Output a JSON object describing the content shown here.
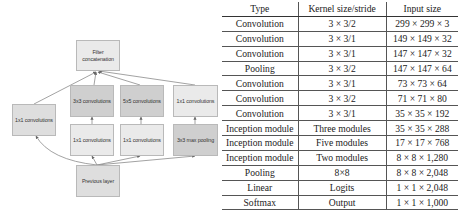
{
  "diagram": {
    "title": "Inception module",
    "nodes": {
      "filter_concat": "Filter concatenation",
      "conv1x1_left": "1x1 convolutions",
      "conv3x3": "3x3 convolutions",
      "conv5x5": "5x5 convolutions",
      "conv1x1_top_right": "1x1 convolutions",
      "conv1x1_mid_a": "1x1 convolutions",
      "conv1x1_mid_b": "1x1 convolutions",
      "maxpool3x3": "3x3 max pooling",
      "previous_layer": "Previous layer"
    },
    "colors": {
      "light": "#eaeaea",
      "mid": "#dedede",
      "dark": "#cfcfcf",
      "edge": "#8a8a8a"
    }
  },
  "table": {
    "headers": [
      "Type",
      "Kernel size/stride",
      "Input size"
    ],
    "rows": [
      [
        "Convolution",
        "3 × 3/2",
        "299 × 299 × 3"
      ],
      [
        "Convolution",
        "3 × 3/1",
        "149 × 149 × 32"
      ],
      [
        "Convolution",
        "3 × 3/1",
        "147 × 147 × 32"
      ],
      [
        "Pooling",
        "3 × 3/2",
        "147 × 147 × 64"
      ],
      [
        "Convolution",
        "3 × 3/1",
        "73 × 73 × 64"
      ],
      [
        "Convolution",
        "3 × 3/2",
        "71 × 71 × 80"
      ],
      [
        "Convolution",
        "3 × 3/1",
        "35 × 35 × 192"
      ],
      [
        "Inception module",
        "Three modules",
        "35 × 35 × 288"
      ],
      [
        "Inception module",
        "Five modules",
        "17 × 17 × 768"
      ],
      [
        "Inception module",
        "Two modules",
        "8 × 8 × 1,280"
      ],
      [
        "Pooling",
        "8×8",
        "8 × 8 × 2,048"
      ],
      [
        "Linear",
        "Logits",
        "1 × 1 × 2,048"
      ],
      [
        "Softmax",
        "Output",
        "1 × 1 × 1,000"
      ]
    ]
  }
}
